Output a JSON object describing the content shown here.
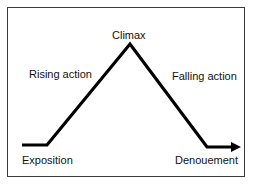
{
  "diagram": {
    "line_color": "#000000",
    "border_color": "#3a3a3a",
    "labels": {
      "climax": "Climax",
      "rising_action": "Rising action",
      "falling_action": "Falling action",
      "exposition": "Exposition",
      "denouement": "Denouement"
    },
    "stages": [
      {
        "name": "Exposition",
        "shape": "flat segment, bottom-left"
      },
      {
        "name": "Rising action",
        "shape": "ascending line"
      },
      {
        "name": "Climax",
        "shape": "peak"
      },
      {
        "name": "Falling action",
        "shape": "descending line"
      },
      {
        "name": "Denouement",
        "shape": "flat segment ending in arrow, bottom-right"
      }
    ]
  }
}
